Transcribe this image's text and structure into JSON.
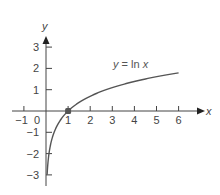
{
  "chart_data": {
    "type": "line",
    "title": "",
    "xlabel": "x",
    "ylabel": "y",
    "xlim": [
      -1.5,
      7
    ],
    "ylim": [
      -3.5,
      3.5
    ],
    "grid": false,
    "x_ticks": [
      -1,
      0,
      1,
      2,
      3,
      4,
      5,
      6
    ],
    "x_tick_labels": [
      "−1",
      "0",
      "1",
      "2",
      "3",
      "4",
      "5",
      "6"
    ],
    "y_ticks": [
      -3,
      -2,
      -1,
      1,
      2,
      3
    ],
    "y_tick_labels": [
      "−3",
      "−2",
      "−1",
      "1",
      "2",
      "3"
    ],
    "series": [
      {
        "name": "y = ln x",
        "function": "ln(x)",
        "x": [
          0.05,
          0.1,
          0.2,
          0.3,
          0.5,
          0.75,
          1,
          1.5,
          2,
          2.5,
          3,
          3.5,
          4,
          4.5,
          5,
          5.5,
          6
        ],
        "y": [
          -3.0,
          -2.3,
          -1.61,
          -1.2,
          -0.69,
          -0.29,
          0,
          0.41,
          0.69,
          0.92,
          1.1,
          1.25,
          1.39,
          1.5,
          1.61,
          1.7,
          1.79
        ],
        "color": "#555555"
      }
    ],
    "annotations": [
      {
        "text": "y = ln x",
        "x": 3.1,
        "y": 2.2
      },
      {
        "type": "point",
        "x": 1,
        "y": 0,
        "color": "#555555"
      }
    ]
  },
  "labels": {
    "x_axis": "x",
    "y_axis": "y",
    "curve": "y = ln x"
  }
}
